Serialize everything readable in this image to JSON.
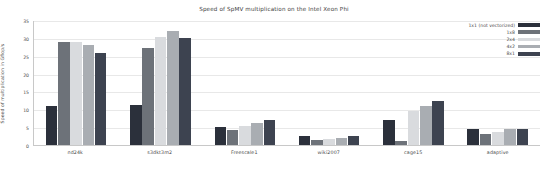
{
  "chart_data": {
    "type": "bar",
    "title": "Speed of SpMV multiplication on the Intel Xeon Phi",
    "xlabel": "",
    "ylabel": "Speed of multiplication in Gflop/s",
    "ylim": [
      0,
      35
    ],
    "yticks": [
      0,
      5,
      10,
      15,
      20,
      25,
      30,
      35
    ],
    "grid": true,
    "legend_position": "top-right",
    "categories": [
      "nd24k",
      "s3dkt3m2",
      "Freescale1",
      "wiki2007",
      "cage15",
      "adaptive"
    ],
    "series": [
      {
        "name": "1x1 (not vectorized)",
        "color": "#2b303b",
        "values": [
          11.0,
          11.2,
          5.0,
          2.6,
          7.0,
          4.6
        ]
      },
      {
        "name": "1x8",
        "color": "#6d7279",
        "values": [
          28.9,
          27.2,
          4.1,
          1.5,
          1.1,
          3.0
        ]
      },
      {
        "name": "2x4",
        "color": "#d9dbde",
        "values": [
          28.8,
          30.2,
          5.4,
          1.8,
          9.4,
          3.6
        ]
      },
      {
        "name": "4x2",
        "color": "#a9adb2",
        "values": [
          28.0,
          31.8,
          6.1,
          2.0,
          11.0,
          4.4
        ]
      },
      {
        "name": "8x1",
        "color": "#3d4350",
        "values": [
          25.8,
          30.0,
          7.0,
          2.5,
          12.4,
          4.5
        ]
      }
    ]
  },
  "legend": {
    "entries": [
      {
        "label": "1x1 (not vectorized)",
        "color": "#2b303b"
      },
      {
        "label": "1x8",
        "color": "#6d7279"
      },
      {
        "label": "2x4",
        "color": "#d9dbde"
      },
      {
        "label": "4x2",
        "color": "#a9adb2"
      },
      {
        "label": "8x1",
        "color": "#3d4350"
      }
    ]
  }
}
